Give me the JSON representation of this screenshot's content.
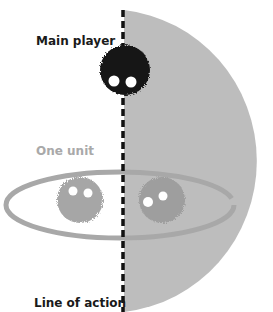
{
  "labels": {
    "main_player": "Main player",
    "one_unit": "One unit",
    "line_of_action": "Line of action"
  },
  "colors": {
    "background": "#ffffff",
    "half_disc": "#bdbdbd",
    "main_player": "#141414",
    "unit": "#a6a6a6",
    "unit_on_disc": "#9e9e9e",
    "ellipse": "#a8a8a8",
    "line_of_action": "#111111",
    "text_dark": "#1a1a1a",
    "text_light": "#a9a9a9"
  }
}
